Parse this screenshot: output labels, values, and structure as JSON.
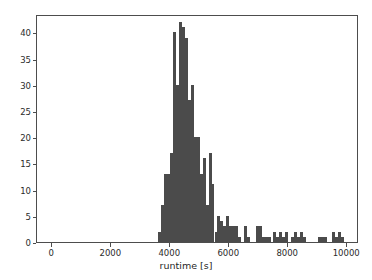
{
  "chart_data": {
    "type": "bar",
    "subtype": "histogram",
    "title": "",
    "subtitle": "",
    "xlabel": "runtime [s]",
    "ylabel": "",
    "xlim": [
      -520,
      10400
    ],
    "ylim": [
      0,
      43.5
    ],
    "grid": false,
    "legend": null,
    "legend_position": "none",
    "bar_color": "#4b4b4b",
    "axis_color": "#4d4d4d",
    "bin_width": 100,
    "xticks": [
      0,
      2000,
      4000,
      6000,
      8000,
      10000
    ],
    "xtick_labels": [
      "0",
      "2000",
      "4000",
      "6000",
      "8000",
      "10000"
    ],
    "yticks": [
      0,
      5,
      10,
      15,
      20,
      25,
      30,
      35,
      40
    ],
    "ytick_labels": [
      "0",
      "5",
      "10",
      "15",
      "20",
      "25",
      "30",
      "35",
      "40"
    ],
    "bin_starts": [
      3600,
      3700,
      3800,
      3900,
      4000,
      4100,
      4200,
      4300,
      4400,
      4500,
      4600,
      4700,
      4800,
      4900,
      5000,
      5100,
      5200,
      5300,
      5400,
      5500,
      5600,
      5700,
      5800,
      5900,
      6000,
      6100,
      6200,
      6300,
      6400,
      6500,
      6600,
      6700,
      6800,
      6900,
      7000,
      7100,
      7200,
      7300,
      7400,
      7500,
      7600,
      7700,
      7800,
      7900,
      8000,
      8100,
      8200,
      8300,
      8400,
      8500,
      8600,
      8700,
      8800,
      8900,
      9000,
      9100,
      9200,
      9300,
      9400,
      9500,
      9600,
      9700,
      9800,
      9900
    ],
    "counts": [
      2,
      7,
      13,
      13,
      17,
      40,
      30,
      42,
      41,
      39,
      27,
      30,
      20,
      20,
      13,
      16,
      7,
      17,
      11,
      2,
      5,
      4,
      3,
      5,
      3,
      3,
      3,
      1,
      0,
      3,
      1,
      0,
      0,
      3,
      3,
      1,
      1,
      1,
      0,
      2,
      1,
      2,
      1,
      2,
      0,
      1,
      2,
      1,
      2,
      1,
      0,
      0,
      0,
      0,
      1,
      1,
      1,
      0,
      0,
      2,
      1,
      2,
      1,
      0
    ],
    "counts_note": "bin counts read from histogram bar heights, bin width 100 s",
    "data_range": {
      "min_runtime": 3600,
      "max_runtime": 9900,
      "peak_bin_start": 4300,
      "peak_count": 42
    }
  },
  "axes": {
    "x_axis_name": "runtime-axis",
    "y_axis_name": "count-axis"
  }
}
